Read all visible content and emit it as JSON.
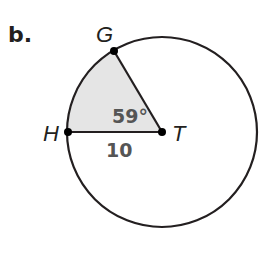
{
  "problem": {
    "part_label": "b."
  },
  "figure": {
    "circle": {
      "center_label": "T",
      "cx": 162,
      "cy": 132,
      "r": 95
    },
    "points": [
      {
        "label": "G",
        "x": 114,
        "y": 51
      },
      {
        "label": "H",
        "x": 68,
        "y": 132
      },
      {
        "label": "T",
        "x": 162,
        "y": 132
      }
    ],
    "sector": {
      "shaded": true,
      "fill": "#e5e5e5",
      "vertices": [
        "G",
        "T",
        "H"
      ]
    },
    "angle_label": "59°",
    "radius_label": "10",
    "colors": {
      "stroke": "#231f20",
      "shade": "#e5e5e5",
      "measure_text": "#555555"
    }
  }
}
